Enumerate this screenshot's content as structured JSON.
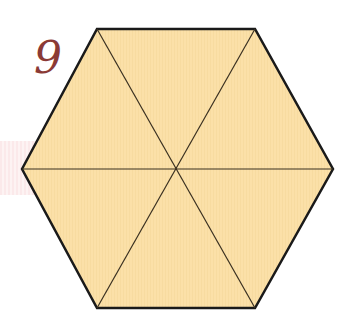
{
  "label": "9",
  "colors": {
    "fill": "#fbe0a8",
    "stroke": "#1a1a1a",
    "inner_stroke": "#3a3020",
    "label": "#8b3a35"
  },
  "hexagon": {
    "vertices": [
      [
        22,
        169
      ],
      [
        97,
        29
      ],
      [
        255,
        29
      ],
      [
        333,
        169
      ],
      [
        255,
        308
      ],
      [
        97,
        308
      ]
    ],
    "center": [
      177,
      169
    ],
    "divisions": 6
  }
}
